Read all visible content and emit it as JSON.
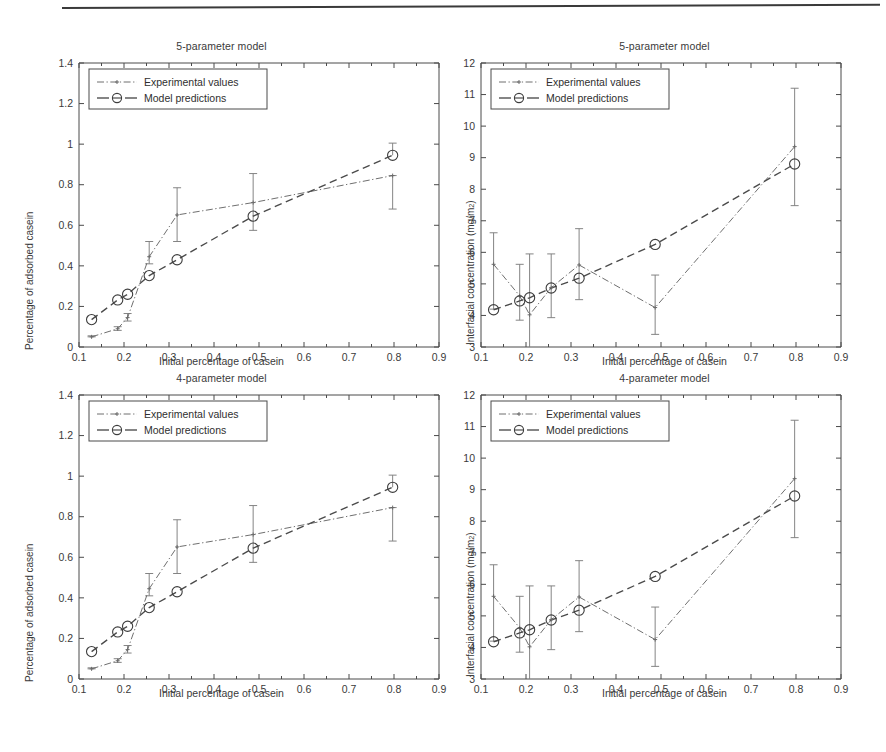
{
  "figure": {
    "panels": [
      {
        "id": "top-left",
        "title": "5-parameter model",
        "xlabel": "Initial percentage of casein",
        "ylabel": "Percentage of adsorbed casein",
        "ylabel_sup": ""
      },
      {
        "id": "top-right",
        "title": "5-parameter model",
        "xlabel": "Initial percentage of casein",
        "ylabel": "Interfacial concentration (mg/m",
        "ylabel_sup": "2"
      },
      {
        "id": "bottom-left",
        "title": "4-parameter model",
        "xlabel": "Initial percentage of casein",
        "ylabel": "Percentage of adsorbed casein",
        "ylabel_sup": ""
      },
      {
        "id": "bottom-right",
        "title": "4-parameter model",
        "xlabel": "Initial percentage of casein",
        "ylabel": "Interfacial concentration (mg/m",
        "ylabel_sup": "2"
      }
    ],
    "legend": {
      "experimental_label": "Experimental values",
      "model_label": "Model predictions"
    }
  },
  "chart_data": [
    {
      "panel": "top-left",
      "type": "line",
      "title": "5-parameter model",
      "xlabel": "Initial percentage of casein",
      "ylabel": "Percentage of adsorbed casein",
      "xlim": [
        0.1,
        0.9
      ],
      "ylim": [
        0,
        1.4
      ],
      "xticks": [
        "0.1",
        "0.2",
        "0.3",
        "0.4",
        "0.5",
        "0.6",
        "0.7",
        "0.8",
        "0.9"
      ],
      "yticks": [
        "0",
        "0.2",
        "0.4",
        "0.6",
        "0.8",
        "1",
        "1.2",
        "1.4"
      ],
      "grid": false,
      "legend_position": "top-left",
      "series": [
        {
          "name": "Experimental values",
          "x": [
            0.128,
            0.186,
            0.208,
            0.256,
            0.318,
            0.487,
            0.797
          ],
          "values": [
            0.05,
            0.09,
            0.145,
            0.445,
            0.651,
            0.712,
            0.845
          ],
          "yerr_low": [
            0.05,
            0.082,
            0.128,
            0.41,
            0.52,
            0.575,
            0.68
          ],
          "yerr_high": [
            0.055,
            0.1,
            0.165,
            0.52,
            0.785,
            0.855,
            0.845
          ]
        },
        {
          "name": "Model predictions",
          "x": [
            0.128,
            0.186,
            0.208,
            0.256,
            0.318,
            0.487,
            0.797
          ],
          "values": [
            0.135,
            0.232,
            0.26,
            0.352,
            0.43,
            0.645,
            0.945
          ],
          "yerr_low": [
            null,
            null,
            null,
            null,
            null,
            null,
            null
          ],
          "yerr_high": [
            null,
            null,
            null,
            null,
            null,
            null,
            1.005
          ]
        }
      ]
    },
    {
      "panel": "top-right",
      "type": "line",
      "title": "5-parameter model",
      "xlabel": "Initial percentage of casein",
      "ylabel": "Interfacial concentration (mg/m2)",
      "xlim": [
        0.1,
        0.9
      ],
      "ylim": [
        3,
        12
      ],
      "xticks": [
        "0.1",
        "0.2",
        "0.3",
        "0.4",
        "0.5",
        "0.6",
        "0.7",
        "0.8",
        "0.9"
      ],
      "yticks": [
        "3",
        "4",
        "5",
        "6",
        "7",
        "8",
        "9",
        "10",
        "11",
        "12"
      ],
      "grid": false,
      "legend_position": "top-left",
      "series": [
        {
          "name": "Experimental values",
          "x": [
            0.128,
            0.186,
            0.208,
            0.256,
            0.318,
            0.487,
            0.797
          ],
          "values": [
            5.62,
            4.62,
            4.02,
            4.88,
            5.6,
            4.25,
            9.35
          ],
          "yerr_low": [
            4.2,
            3.85,
            2.75,
            3.93,
            4.5,
            3.4,
            7.48
          ],
          "yerr_high": [
            6.62,
            5.62,
            5.95,
            5.95,
            6.75,
            5.28,
            11.2
          ]
        },
        {
          "name": "Model predictions",
          "x": [
            0.128,
            0.186,
            0.208,
            0.256,
            0.318,
            0.487,
            0.797
          ],
          "values": [
            4.18,
            4.46,
            4.56,
            4.87,
            5.18,
            6.25,
            8.8
          ],
          "yerr_low": [
            null,
            null,
            null,
            null,
            null,
            null,
            null
          ],
          "yerr_high": [
            null,
            null,
            null,
            null,
            null,
            null,
            null
          ]
        }
      ]
    },
    {
      "panel": "bottom-left",
      "type": "line",
      "title": "4-parameter model",
      "xlabel": "Initial percentage of casein",
      "ylabel": "Percentage of adsorbed casein",
      "xlim": [
        0.1,
        0.9
      ],
      "ylim": [
        0,
        1.4
      ],
      "xticks": [
        "0.1",
        "0.2",
        "0.3",
        "0.4",
        "0.5",
        "0.6",
        "0.7",
        "0.8",
        "0.9"
      ],
      "yticks": [
        "0",
        "0.2",
        "0.4",
        "0.6",
        "0.8",
        "1",
        "1.2",
        "1.4"
      ],
      "grid": false,
      "legend_position": "top-left",
      "series": [
        {
          "name": "Experimental values",
          "x": [
            0.128,
            0.186,
            0.208,
            0.256,
            0.318,
            0.487,
            0.797
          ],
          "values": [
            0.05,
            0.09,
            0.145,
            0.445,
            0.651,
            0.712,
            0.845
          ],
          "yerr_low": [
            0.05,
            0.082,
            0.128,
            0.41,
            0.52,
            0.575,
            0.68
          ],
          "yerr_high": [
            0.055,
            0.1,
            0.165,
            0.52,
            0.785,
            0.855,
            0.845
          ]
        },
        {
          "name": "Model predictions",
          "x": [
            0.128,
            0.186,
            0.208,
            0.256,
            0.318,
            0.487,
            0.797
          ],
          "values": [
            0.135,
            0.232,
            0.26,
            0.352,
            0.43,
            0.645,
            0.945
          ],
          "yerr_low": [
            null,
            null,
            null,
            null,
            null,
            null,
            null
          ],
          "yerr_high": [
            null,
            null,
            null,
            null,
            null,
            null,
            1.005
          ]
        }
      ]
    },
    {
      "panel": "bottom-right",
      "type": "line",
      "title": "4-parameter model",
      "xlabel": "Initial percentage of casein",
      "ylabel": "Interfacial concentration (mg/m2)",
      "xlim": [
        0.1,
        0.9
      ],
      "ylim": [
        3,
        12
      ],
      "xticks": [
        "0.1",
        "0.2",
        "0.3",
        "0.4",
        "0.5",
        "0.6",
        "0.7",
        "0.8",
        "0.9"
      ],
      "yticks": [
        "3",
        "4",
        "5",
        "6",
        "7",
        "8",
        "9",
        "10",
        "11",
        "12"
      ],
      "grid": false,
      "legend_position": "top-left",
      "series": [
        {
          "name": "Experimental values",
          "x": [
            0.128,
            0.186,
            0.208,
            0.256,
            0.318,
            0.487,
            0.797
          ],
          "values": [
            5.62,
            4.62,
            4.02,
            4.88,
            5.6,
            4.25,
            9.35
          ],
          "yerr_low": [
            4.2,
            3.85,
            2.75,
            3.93,
            4.5,
            3.4,
            7.48
          ],
          "yerr_high": [
            6.62,
            5.62,
            5.95,
            5.95,
            6.75,
            5.28,
            11.2
          ]
        },
        {
          "name": "Model predictions",
          "x": [
            0.128,
            0.186,
            0.208,
            0.256,
            0.318,
            0.487,
            0.797
          ],
          "values": [
            4.18,
            4.46,
            4.56,
            4.87,
            5.18,
            6.25,
            8.8
          ],
          "yerr_low": [
            null,
            null,
            null,
            null,
            null,
            null,
            null
          ],
          "yerr_high": [
            null,
            null,
            null,
            null,
            null,
            null,
            null
          ]
        }
      ]
    }
  ]
}
